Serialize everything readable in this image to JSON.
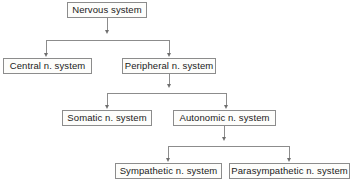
{
  "diagram": {
    "type": "hierarchy-flowchart",
    "colors": {
      "background": "#ffffff",
      "box_border": "#8c8c8c",
      "box_fill": "#fdfdfb",
      "connector": "#8c8c8c",
      "text": "#1a1a1a"
    },
    "nodes": [
      {
        "id": "nervous-system",
        "label": "Nervous system",
        "level": 0
      },
      {
        "id": "central-n-system",
        "label": "Central n. system",
        "level": 1
      },
      {
        "id": "peripheral-n-system",
        "label": "Peripheral n. system",
        "level": 1
      },
      {
        "id": "somatic-n-system",
        "label": "Somatic n. system",
        "level": 2
      },
      {
        "id": "autonomic-n-system",
        "label": "Autonomic n. system",
        "level": 2
      },
      {
        "id": "sympathetic-n-system",
        "label": "Sympathetic n. system",
        "level": 3
      },
      {
        "id": "parasympathetic-n-system",
        "label": "Parasympathetic n. system",
        "level": 3
      }
    ],
    "edges": [
      {
        "from": "nervous-system",
        "to": "central-n-system",
        "arrow": "down"
      },
      {
        "from": "nervous-system",
        "to": "peripheral-n-system",
        "arrow": "down"
      },
      {
        "from": "peripheral-n-system",
        "to": "somatic-n-system",
        "arrow": "down"
      },
      {
        "from": "peripheral-n-system",
        "to": "autonomic-n-system",
        "arrow": "down"
      },
      {
        "from": "autonomic-n-system",
        "to": "sympathetic-n-system",
        "arrow": "down"
      },
      {
        "from": "autonomic-n-system",
        "to": "parasympathetic-n-system",
        "arrow": "down"
      }
    ]
  }
}
